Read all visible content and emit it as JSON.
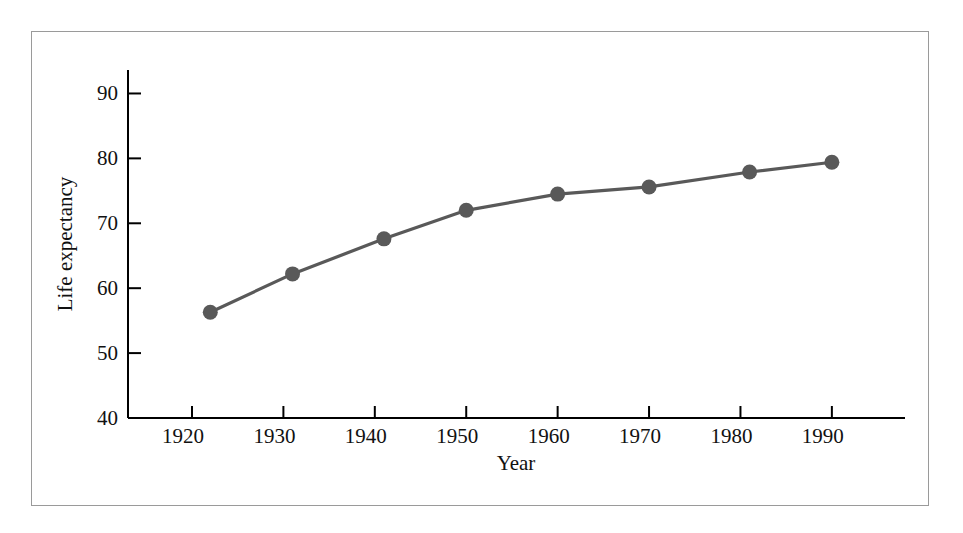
{
  "figure": {
    "background_color": "#ffffff",
    "frame_color": "#9a9a9a",
    "axis_color": "#000000",
    "series_color": "#595959"
  },
  "chart_data": {
    "type": "line",
    "title": "",
    "subtitle": "",
    "xlabel": "Year",
    "ylabel": "Life expectancy",
    "grid": false,
    "legend": false,
    "legend_position": "none",
    "marker": "circle",
    "marker_color": "#595959",
    "line_color": "#595959",
    "xlim": [
      1913,
      1998
    ],
    "ylim": [
      40,
      93
    ],
    "xticks": [
      1920,
      1930,
      1940,
      1950,
      1960,
      1970,
      1980,
      1990
    ],
    "xtick_labels": [
      "1920",
      "1930",
      "1940",
      "1950",
      "1960",
      "1970",
      "1980",
      "1990"
    ],
    "yticks": [
      40,
      50,
      60,
      70,
      80,
      90
    ],
    "ytick_labels": [
      "40",
      "50",
      "60",
      "70",
      "80",
      "90"
    ],
    "x": [
      1922,
      1931,
      1941,
      1950,
      1960,
      1970,
      1981,
      1990
    ],
    "values": [
      56.3,
      62.2,
      67.6,
      72.0,
      74.5,
      75.6,
      77.9,
      79.4
    ],
    "points": [
      {
        "x": 1922,
        "y": 56.3
      },
      {
        "x": 1931,
        "y": 62.2
      },
      {
        "x": 1941,
        "y": 67.6
      },
      {
        "x": 1950,
        "y": 72.0
      },
      {
        "x": 1960,
        "y": 74.5
      },
      {
        "x": 1970,
        "y": 75.6
      },
      {
        "x": 1981,
        "y": 77.9
      },
      {
        "x": 1990,
        "y": 79.4
      }
    ]
  }
}
